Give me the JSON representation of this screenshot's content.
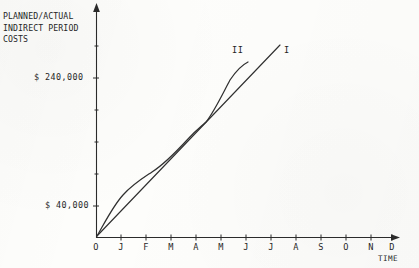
{
  "chart_data": {
    "type": "line",
    "title": "PLANNED/ACTUAL INDIRECT PERIOD COSTS",
    "title_lines": [
      "PLANNED/ACTUAL",
      "INDIRECT PERIOD",
      "COSTS"
    ],
    "xlabel": "TIME",
    "ylabel": "PLANNED/ACTUAL INDIRECT PERIOD COSTS",
    "grid": false,
    "legend_position": "inline-at-curve-end",
    "categories": [
      "O",
      "J",
      "F",
      "M",
      "A",
      "M",
      "J",
      "J",
      "A",
      "S",
      "O",
      "N",
      "D"
    ],
    "xtick_labels": [
      "O",
      "J",
      "F",
      "M",
      "A",
      "M",
      "J",
      "J",
      "A",
      "S",
      "O",
      "N",
      "D"
    ],
    "ytick_labels": [
      "$ 40,000",
      "$ 240,000"
    ],
    "ytick_values": [
      40000,
      240000
    ],
    "ylim": [
      0,
      360000
    ],
    "xlim": [
      0,
      12
    ],
    "series": [
      {
        "name": "I",
        "label": "I",
        "style": "straight-line",
        "description": "Planned straight-line accrual of indirect period costs",
        "x": [
          "O",
          "J",
          "F",
          "M",
          "A",
          "M",
          "J",
          "J"
        ],
        "values": [
          0,
          40000,
          80000,
          120000,
          160000,
          200000,
          240000,
          280000
        ]
      },
      {
        "name": "II",
        "label": "II",
        "style": "s-curve",
        "description": "Actual S-curve accrual of indirect period costs, crossing line I twice",
        "x": [
          "O",
          "J",
          "F",
          "M",
          "A",
          "M",
          "J"
        ],
        "values": [
          0,
          58000,
          92000,
          122000,
          170000,
          232000,
          272000
        ]
      }
    ],
    "annotations": [
      {
        "text": "II",
        "at_x": "J",
        "note": "label at end of S-curve"
      },
      {
        "text": "I",
        "at_x": "J",
        "note": "label at end of straight line"
      }
    ]
  },
  "axes": {
    "y_axis_name": "vertical-cost-axis",
    "x_axis_name": "horizontal-time-axis",
    "y_arrow": true,
    "x_arrow": true
  }
}
